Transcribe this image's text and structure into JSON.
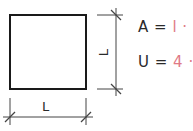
{
  "diagram": {
    "shape": "square",
    "side_label_bottom": "L",
    "side_label_right": "L",
    "colors": {
      "stroke": "#1a1a1a",
      "dimension": "#444444",
      "accent": "#e07a86",
      "text": "#2a2a2a"
    }
  },
  "formulas": [
    {
      "lhs": "A =",
      "rhs": "l · l"
    },
    {
      "lhs": "U =",
      "rhs": "4 · l"
    }
  ]
}
